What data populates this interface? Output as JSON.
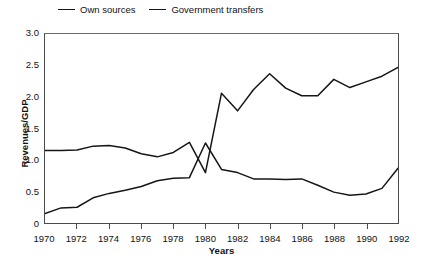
{
  "chart_data": {
    "type": "line",
    "title": "",
    "xlabel": "Years",
    "ylabel": "Revenues/GDP",
    "xlim": [
      1970,
      1992
    ],
    "ylim": [
      0,
      3.0
    ],
    "grid": false,
    "legend_position": "top-left",
    "xticks": [
      1970,
      1972,
      1974,
      1976,
      1978,
      1980,
      1982,
      1984,
      1986,
      1988,
      1990,
      1992
    ],
    "xtick_labels": [
      "1970",
      "1972",
      "1974",
      "1976",
      "1978",
      "1980",
      "1982",
      "1984",
      "1986",
      "1988",
      "1990",
      "1992"
    ],
    "yticks": [
      0,
      0.5,
      1.0,
      1.5,
      2.0,
      2.5,
      3.0
    ],
    "ytick_labels": [
      "0",
      "0.5",
      "1.0",
      "1.5",
      "2.0",
      "2.5",
      "3.0"
    ],
    "x": [
      1970,
      1971,
      1972,
      1973,
      1974,
      1975,
      1976,
      1977,
      1978,
      1979,
      1980,
      1981,
      1982,
      1983,
      1984,
      1985,
      1986,
      1987,
      1988,
      1989,
      1990,
      1991,
      1992
    ],
    "series": [
      {
        "name": "Own sources",
        "color": "#161616",
        "values": [
          0.15,
          0.24,
          0.25,
          0.4,
          0.47,
          0.52,
          0.58,
          0.67,
          0.71,
          0.72,
          1.27,
          0.85,
          0.8,
          0.7,
          0.7,
          0.69,
          0.7,
          0.6,
          0.49,
          0.44,
          0.46,
          0.55,
          0.87
        ]
      },
      {
        "name": "Government transfers",
        "color": "#161616",
        "values": [
          1.15,
          1.15,
          1.16,
          1.22,
          1.23,
          1.19,
          1.1,
          1.05,
          1.12,
          1.28,
          0.8,
          2.06,
          1.78,
          2.12,
          2.37,
          2.14,
          2.02,
          2.02,
          2.28,
          2.15,
          2.24,
          2.33,
          2.47
        ]
      }
    ]
  },
  "legend": {
    "entries": [
      {
        "label": "Own sources"
      },
      {
        "label": "Government transfers"
      }
    ]
  },
  "axes": {
    "y_title": "Revenues/GDP",
    "x_title": "Years"
  }
}
